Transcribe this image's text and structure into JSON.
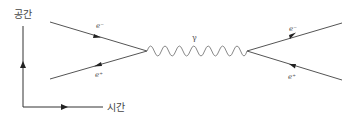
{
  "diagram": {
    "type": "feynman-diagram",
    "axes": {
      "y_label": "공간",
      "x_label": "시간"
    },
    "particles": {
      "in_electron": "e⁻",
      "in_positron": "e⁺",
      "photon": "γ",
      "out_electron": "e⁻",
      "out_positron": "e⁺"
    },
    "colors": {
      "line": "#555555",
      "photon": "#888888",
      "text": "#444444"
    }
  }
}
